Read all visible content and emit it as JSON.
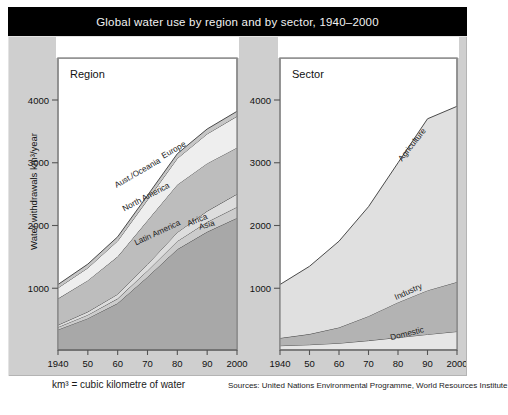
{
  "title": "Global water use by region and by sector, 1940–2000",
  "footnotes": {
    "unit": "km³ = cubic kilometre of water",
    "sources": "Sources: United Nations Environmental Programme, World Resources Institute"
  },
  "axis": {
    "y_label": "Water withdrawals km³/year",
    "y_ticks": [
      "1000",
      "2000",
      "3000",
      "4000"
    ],
    "x_ticks": [
      "1940",
      "50",
      "60",
      "70",
      "80",
      "90",
      "2000"
    ]
  },
  "colors": {
    "title_bar": "#000000",
    "board": "#cfcfcf",
    "plot_bg": "#ffffff",
    "band_outline": "#4a4a4a",
    "band_light": "#f0f0f0",
    "band_mid": "#d8d8d8",
    "band_dark": "#b8b8b8",
    "band_base": "#a8a8a8"
  },
  "chart_data": [
    {
      "type": "area",
      "title": "Region",
      "stacked": true,
      "xlabel": "",
      "ylabel": "Water withdrawals km³/year",
      "xlim": [
        1940,
        2000
      ],
      "ylim": [
        0,
        4500
      ],
      "yticks": [
        1000,
        2000,
        3000,
        4000
      ],
      "x": [
        1940,
        1950,
        1960,
        1970,
        1980,
        1990,
        2000
      ],
      "xtick_labels": [
        "1940",
        "50",
        "60",
        "70",
        "80",
        "90",
        "2000"
      ],
      "grid": false,
      "legend": "inline-annotations",
      "series": [
        {
          "name": "Asia",
          "fill": "#a8a8a8",
          "values": [
            340,
            520,
            760,
            1180,
            1620,
            1900,
            2120
          ]
        },
        {
          "name": "Africa",
          "fill": "#cccccc",
          "values": [
            40,
            55,
            75,
            100,
            130,
            155,
            175
          ]
        },
        {
          "name": "Latin America",
          "fill": "#dddddd",
          "values": [
            35,
            50,
            70,
            100,
            140,
            175,
            205
          ]
        },
        {
          "name": "North America",
          "fill": "#bdbdbd",
          "values": [
            420,
            500,
            600,
            700,
            760,
            760,
            740
          ]
        },
        {
          "name": "Europe",
          "fill": "#eeeeee",
          "values": [
            170,
            200,
            250,
            330,
            420,
            470,
            500
          ]
        },
        {
          "name": "Aust./Oceania",
          "fill": "#c6c6c6",
          "values": [
            55,
            60,
            65,
            70,
            75,
            78,
            80
          ]
        }
      ]
    },
    {
      "type": "area",
      "title": "Sector",
      "stacked": true,
      "xlabel": "",
      "ylabel": "",
      "xlim": [
        1940,
        2000
      ],
      "ylim": [
        0,
        4500
      ],
      "yticks": [
        1000,
        2000,
        3000,
        4000
      ],
      "x": [
        1940,
        1950,
        1960,
        1970,
        1980,
        1990,
        2000
      ],
      "xtick_labels": [
        "1940",
        "50",
        "60",
        "70",
        "80",
        "90",
        "2000"
      ],
      "grid": false,
      "legend": "inline-annotations",
      "series": [
        {
          "name": "Domestic",
          "fill": "#e6e6e6",
          "values": [
            85,
            100,
            125,
            165,
            215,
            265,
            310
          ]
        },
        {
          "name": "Industry",
          "fill": "#b3b3b3",
          "values": [
            120,
            170,
            250,
            390,
            560,
            700,
            790
          ]
        },
        {
          "name": "Agriculture",
          "fill": "#e0e0e0",
          "values": [
            855,
            1080,
            1375,
            1745,
            2225,
            2735,
            2800
          ]
        }
      ]
    }
  ],
  "annotations": {
    "region": [
      {
        "label": "Aust./Oceania"
      },
      {
        "label": "Europe"
      },
      {
        "label": "North America"
      },
      {
        "label": "Latin America"
      },
      {
        "label": "Africa"
      },
      {
        "label": "Asia"
      }
    ],
    "sector": [
      {
        "label": "Agriculture"
      },
      {
        "label": "Industry"
      },
      {
        "label": "Domestic"
      }
    ]
  }
}
